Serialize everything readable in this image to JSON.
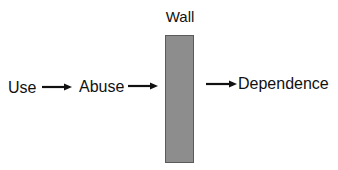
{
  "diagram": {
    "wall": {
      "label": "Wall",
      "fill": "#8d8d8d",
      "border": "#5a5a5a"
    },
    "nodes": [
      {
        "id": "use",
        "label": "Use"
      },
      {
        "id": "abuse",
        "label": "Abuse"
      },
      {
        "id": "dependence",
        "label": "Dependence"
      }
    ],
    "edges": [
      {
        "from": "use",
        "to": "abuse"
      },
      {
        "from": "abuse",
        "to": "wall"
      },
      {
        "from": "wall",
        "to": "dependence"
      }
    ],
    "arrow_color": "#111111"
  }
}
